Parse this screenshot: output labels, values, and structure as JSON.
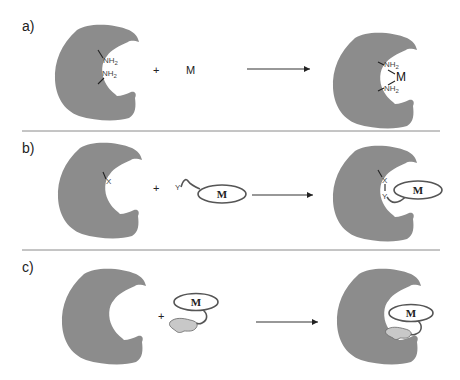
{
  "figure": {
    "panels": [
      {
        "label": "a)",
        "plus": "+",
        "reactant": "M",
        "left_groups": [
          "NH",
          "NH"
        ],
        "subscript": "2",
        "product_metal": "M"
      },
      {
        "label": "b)",
        "plus": "+",
        "site_group": "X",
        "ligand_group": "Y",
        "complex_label": "M",
        "product_groups": [
          "X",
          "Y"
        ]
      },
      {
        "label": "c)",
        "plus": "+",
        "complex_label": "M"
      }
    ],
    "colors": {
      "protein": "#8c8c8c",
      "anchor": "#c8c8c8",
      "divider": "#8a8a8a"
    }
  }
}
